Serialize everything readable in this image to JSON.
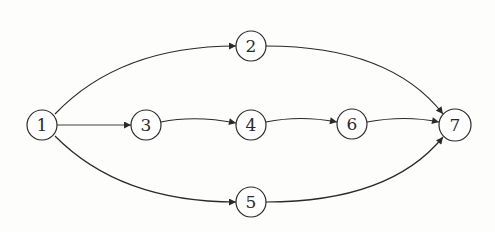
{
  "diagram": {
    "type": "directed-graph",
    "colors": {
      "stroke": "#2a2a2a",
      "node_fill": "#ffffff",
      "background": "#fdfdfb"
    },
    "nodes": [
      {
        "id": "1",
        "label": "1",
        "x": 42,
        "y": 125
      },
      {
        "id": "2",
        "label": "2",
        "x": 251,
        "y": 46
      },
      {
        "id": "3",
        "label": "3",
        "x": 146,
        "y": 125
      },
      {
        "id": "4",
        "label": "4",
        "x": 251,
        "y": 125
      },
      {
        "id": "5",
        "label": "5",
        "x": 251,
        "y": 202
      },
      {
        "id": "6",
        "label": "6",
        "x": 352,
        "y": 124
      },
      {
        "id": "7",
        "label": "7",
        "x": 455,
        "y": 125
      }
    ],
    "edges": [
      {
        "from": "1",
        "to": "2"
      },
      {
        "from": "1",
        "to": "3"
      },
      {
        "from": "1",
        "to": "5"
      },
      {
        "from": "3",
        "to": "4"
      },
      {
        "from": "4",
        "to": "6"
      },
      {
        "from": "2",
        "to": "7"
      },
      {
        "from": "6",
        "to": "7"
      },
      {
        "from": "5",
        "to": "7"
      }
    ]
  }
}
